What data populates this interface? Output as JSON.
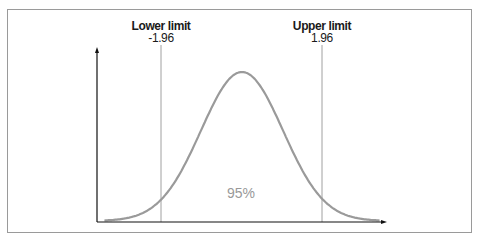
{
  "chart_data": {
    "type": "line",
    "title": "",
    "xlabel": "",
    "ylabel": "",
    "series": [
      {
        "name": "normal density",
        "x": [
          -3.5,
          -3,
          -2.5,
          -1.96,
          -1.5,
          -1,
          -0.5,
          0,
          0.5,
          1,
          1.5,
          1.96,
          2.5,
          3,
          3.5
        ],
        "values": [
          0.0009,
          0.0044,
          0.0175,
          0.0584,
          0.1295,
          0.242,
          0.3521,
          0.3989,
          0.3521,
          0.242,
          0.1295,
          0.0584,
          0.0175,
          0.0044,
          0.0009
        ]
      }
    ],
    "annotations": [
      {
        "label": "Lower limit",
        "value": "-1.96",
        "x": -1.96
      },
      {
        "label": "Upper limit",
        "value": "1.96",
        "x": 1.96
      },
      {
        "label": "95%",
        "x": 0
      }
    ],
    "grid": false,
    "legend": null
  },
  "labels": {
    "lower_title": "Lower limit",
    "lower_value": "-1.96",
    "upper_title": "Upper limit",
    "upper_value": "1.96",
    "area_pct": "95%"
  },
  "colors": {
    "curve": "#9a9a9a",
    "axis": "#111111",
    "limit_line": "#9a9a9a",
    "pct_text": "#999999"
  }
}
